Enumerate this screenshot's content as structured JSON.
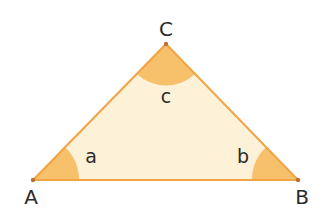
{
  "diagram": {
    "type": "triangle",
    "colors": {
      "fill": "#FDF1D8",
      "angle_sector": "#F7C06A",
      "edge": "#F2A445",
      "vertex_dot": "#B87333",
      "text": "#2B2B2B"
    },
    "vertices": [
      {
        "name": "A",
        "label": "A",
        "x": 33,
        "y": 180
      },
      {
        "name": "B",
        "label": "B",
        "x": 298,
        "y": 180
      },
      {
        "name": "C",
        "label": "C",
        "x": 166,
        "y": 44
      }
    ],
    "angles": [
      {
        "vertex": "A",
        "label": "a"
      },
      {
        "vertex": "B",
        "label": "b"
      },
      {
        "vertex": "C",
        "label": "c"
      }
    ]
  }
}
